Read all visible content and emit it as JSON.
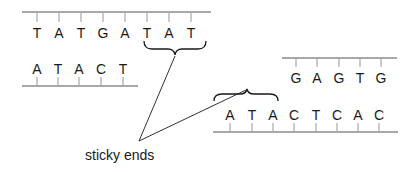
{
  "diagram": {
    "label": "sticky ends",
    "fragment_left": {
      "top_strand": [
        "T",
        "A",
        "T",
        "G",
        "A",
        "T",
        "A",
        "T"
      ],
      "bottom_strand": [
        "A",
        "T",
        "A",
        "C",
        "T"
      ],
      "sticky_end_bases": [
        "T",
        "A",
        "T"
      ]
    },
    "fragment_right": {
      "top_strand": [
        "G",
        "A",
        "G",
        "T",
        "G"
      ],
      "bottom_strand": [
        "A",
        "T",
        "A",
        "C",
        "T",
        "C",
        "A",
        "C"
      ],
      "sticky_end_bases": [
        "A",
        "T",
        "A"
      ]
    },
    "colors": {
      "backbone": "#a8a8a8",
      "text": "#1a1a1a",
      "background": "#ffffff"
    }
  }
}
